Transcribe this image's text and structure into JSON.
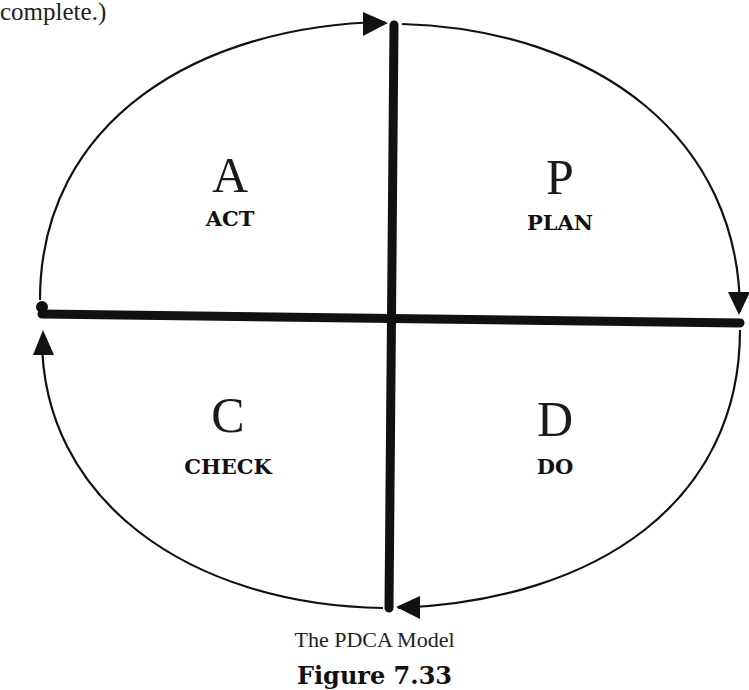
{
  "intro_text": "complete.)",
  "diagram": {
    "title": "The PDCA Model",
    "figure_label": "Figure 7.33",
    "quadrants": [
      {
        "position": "top-left",
        "letter": "A",
        "word": "ACT"
      },
      {
        "position": "top-right",
        "letter": "P",
        "word": "PLAN"
      },
      {
        "position": "bottom-left",
        "letter": "C",
        "word": "CHECK"
      },
      {
        "position": "bottom-right",
        "letter": "D",
        "word": "DO"
      }
    ],
    "flow": "clockwise: Plan -> Do -> Check -> Act",
    "colors": {
      "line": "#111111",
      "background": "#ffffff"
    }
  }
}
